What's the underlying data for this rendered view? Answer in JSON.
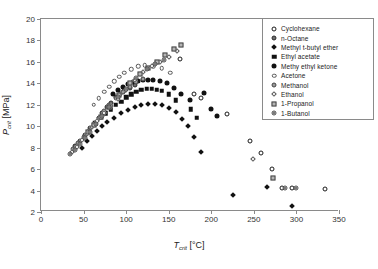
{
  "chart_data": {
    "type": "scatter",
    "title": "",
    "xlabel": "T_crit [°C]",
    "ylabel": "P_crit [MPa]",
    "xlabel_sym": "T",
    "xlabel_sub": "crit",
    "xlabel_unit": "[°C]",
    "ylabel_sym": "P",
    "ylabel_sub": "crit",
    "ylabel_unit": "[MPa]",
    "xlim": [
      0,
      350
    ],
    "ylim": [
      2,
      20
    ],
    "xticks": [
      0,
      50,
      100,
      150,
      200,
      250,
      300,
      350
    ],
    "yticks": [
      2,
      4,
      6,
      8,
      10,
      12,
      14,
      16,
      18,
      20
    ],
    "grid": false,
    "legend_position": "upper-right",
    "series": [
      {
        "name": "Cyclohexane",
        "marker": "open-circle",
        "color": "#ffffff",
        "edge": "#1a1a1a",
        "points": [
          [
            163,
            16.3
          ],
          [
            180,
            13.0
          ],
          [
            188,
            12.6
          ],
          [
            218,
            11.1
          ],
          [
            246,
            8.6
          ],
          [
            258,
            7.5
          ],
          [
            271,
            6.0
          ],
          [
            283,
            4.2
          ],
          [
            295,
            4.2
          ],
          [
            333,
            4.1
          ]
        ]
      },
      {
        "name": "n-Octane",
        "marker": "filled-grey-circle",
        "color": "#6e6e6e",
        "edge": "#2a2a2a",
        "points": [
          [
            40,
            8.2
          ],
          [
            46,
            8.6
          ],
          [
            52,
            9.2
          ],
          [
            58,
            9.8
          ],
          [
            63,
            10.3
          ],
          [
            68,
            10.8
          ],
          [
            72,
            11.2
          ],
          [
            78,
            11.8
          ],
          [
            82,
            12.2
          ],
          [
            88,
            12.7
          ],
          [
            93,
            13.0
          ],
          [
            98,
            13.3
          ],
          [
            104,
            13.6
          ],
          [
            110,
            13.8
          ]
        ]
      },
      {
        "name": "Methyl t-butyl ether",
        "marker": "filled-diamond",
        "color": "#111111",
        "edge": "#111111",
        "points": [
          [
            48,
            8.0
          ],
          [
            54,
            8.6
          ],
          [
            60,
            9.1
          ],
          [
            66,
            9.6
          ],
          [
            72,
            10.0
          ],
          [
            78,
            10.4
          ],
          [
            86,
            10.8
          ],
          [
            94,
            11.2
          ],
          [
            102,
            11.5
          ],
          [
            110,
            11.8
          ],
          [
            118,
            12.0
          ],
          [
            126,
            12.1
          ],
          [
            134,
            12.1
          ],
          [
            142,
            12.0
          ],
          [
            150,
            11.7
          ],
          [
            158,
            11.3
          ],
          [
            166,
            10.7
          ],
          [
            173,
            10.0
          ],
          [
            180,
            9.0
          ],
          [
            188,
            7.6
          ],
          [
            225,
            3.6
          ],
          [
            265,
            4.3
          ],
          [
            295,
            2.6
          ]
        ]
      },
      {
        "name": "Ethyl acetate",
        "marker": "filled-square",
        "color": "#111111",
        "edge": "#111111",
        "points": [
          [
            64,
            10.3
          ],
          [
            70,
            10.8
          ],
          [
            76,
            11.2
          ],
          [
            82,
            11.6
          ],
          [
            88,
            12.0
          ],
          [
            94,
            12.3
          ],
          [
            100,
            12.7
          ],
          [
            106,
            13.0
          ],
          [
            112,
            13.2
          ],
          [
            118,
            13.4
          ],
          [
            124,
            13.5
          ],
          [
            130,
            13.5
          ],
          [
            136,
            13.4
          ],
          [
            142,
            13.3
          ],
          [
            150,
            13.0
          ],
          [
            158,
            12.4
          ],
          [
            176,
            11.6
          ],
          [
            183,
            10.8
          ]
        ]
      },
      {
        "name": "Methy ethyl ketone",
        "marker": "filled-circle",
        "color": "#111111",
        "edge": "#111111",
        "points": [
          [
            84,
            13.0
          ],
          [
            90,
            13.4
          ],
          [
            96,
            13.7
          ],
          [
            102,
            13.9
          ],
          [
            108,
            14.1
          ],
          [
            114,
            14.2
          ],
          [
            120,
            14.3
          ],
          [
            126,
            14.3
          ],
          [
            132,
            14.3
          ],
          [
            140,
            14.2
          ],
          [
            148,
            14.0
          ],
          [
            156,
            13.6
          ],
          [
            164,
            13.0
          ],
          [
            175,
            12.4
          ],
          [
            191,
            13.1
          ],
          [
            200,
            11.6
          ],
          [
            207,
            11.0
          ]
        ]
      },
      {
        "name": "Acetone",
        "marker": "open-circle-small",
        "color": "#ffffff",
        "edge": "#555555",
        "points": [
          [
            62,
            12.0
          ],
          [
            68,
            12.6
          ],
          [
            74,
            13.2
          ],
          [
            80,
            13.7
          ],
          [
            86,
            14.2
          ],
          [
            92,
            14.6
          ],
          [
            98,
            15.0
          ],
          [
            106,
            15.3
          ],
          [
            114,
            15.6
          ],
          [
            122,
            15.7
          ],
          [
            132,
            15.6
          ],
          [
            142,
            15.4
          ],
          [
            152,
            15.0
          ]
        ]
      },
      {
        "name": "Methanol",
        "marker": "grey-circle",
        "color": "#9a9a9a",
        "edge": "#444444",
        "points": [
          [
            38,
            7.9
          ],
          [
            44,
            8.4
          ],
          [
            50,
            9.0
          ],
          [
            56,
            9.6
          ],
          [
            62,
            10.2
          ],
          [
            68,
            10.8
          ],
          [
            74,
            11.4
          ],
          [
            80,
            12.0
          ],
          [
            88,
            12.6
          ],
          [
            96,
            13.2
          ],
          [
            104,
            13.7
          ],
          [
            112,
            14.1
          ],
          [
            120,
            14.4
          ]
        ]
      },
      {
        "name": "Ethanol",
        "marker": "open-diamond",
        "color": "#ffffff",
        "edge": "#555555",
        "points": [
          [
            36,
            7.6
          ],
          [
            42,
            8.1
          ],
          [
            48,
            8.7
          ],
          [
            54,
            9.3
          ],
          [
            60,
            9.9
          ],
          [
            66,
            10.5
          ],
          [
            74,
            11.2
          ],
          [
            82,
            11.9
          ],
          [
            90,
            12.5
          ],
          [
            100,
            13.4
          ],
          [
            110,
            14.3
          ],
          [
            120,
            15.1
          ],
          [
            130,
            15.6
          ],
          [
            140,
            16.0
          ],
          [
            150,
            16.5
          ],
          [
            160,
            17.0
          ],
          [
            249,
            6.9
          ]
        ]
      },
      {
        "name": "1-Propanol",
        "marker": "grey-square",
        "color": "#b5b5b5",
        "edge": "#444444",
        "points": [
          [
            55,
            9.5
          ],
          [
            62,
            10.1
          ],
          [
            70,
            10.9
          ],
          [
            80,
            11.8
          ],
          [
            92,
            12.9
          ],
          [
            104,
            14.0
          ],
          [
            116,
            14.9
          ],
          [
            126,
            15.4
          ],
          [
            136,
            16.0
          ],
          [
            146,
            16.6
          ],
          [
            156,
            17.2
          ],
          [
            165,
            17.6
          ],
          [
            272,
            5.2
          ]
        ]
      },
      {
        "name": "1-Butanol",
        "marker": "dot-circle",
        "color": "#7a7a7a",
        "edge": "#444444",
        "points": [
          [
            34,
            7.4
          ],
          [
            40,
            7.8
          ],
          [
            46,
            8.3
          ],
          [
            52,
            8.9
          ],
          [
            58,
            9.5
          ],
          [
            65,
            10.2
          ],
          [
            72,
            11.0
          ],
          [
            80,
            11.8
          ],
          [
            90,
            12.7
          ],
          [
            100,
            13.5
          ],
          [
            112,
            14.5
          ],
          [
            124,
            15.3
          ],
          [
            134,
            15.8
          ],
          [
            144,
            16.2
          ],
          [
            286,
            4.2
          ],
          [
            300,
            4.2
          ]
        ]
      }
    ]
  }
}
